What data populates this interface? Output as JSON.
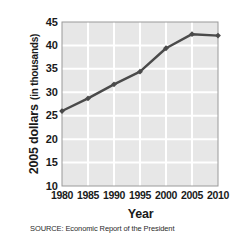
{
  "chart_data": {
    "type": "line",
    "title": "",
    "xlabel": "Year",
    "ylabel": "2005 dollars (in thousands)",
    "ylabel_main": "2005 dollars",
    "ylabel_sub": "(in thousands)",
    "x": [
      1980,
      1985,
      1990,
      1995,
      2000,
      2005,
      2010
    ],
    "values": [
      26.0,
      28.7,
      31.7,
      34.4,
      39.4,
      42.4,
      42.1
    ],
    "series": [
      {
        "name": "2005 dollars (in thousands)",
        "values": [
          26.0,
          28.7,
          31.7,
          34.4,
          39.4,
          42.4,
          42.1
        ]
      }
    ],
    "xtick_labels": [
      "1980",
      "1985",
      "1990",
      "1995",
      "2000",
      "2005",
      "2010"
    ],
    "ytick_labels": [
      "10",
      "15",
      "20",
      "25",
      "30",
      "35",
      "40",
      "45"
    ],
    "ytick_values": [
      10,
      15,
      20,
      25,
      30,
      35,
      40,
      45
    ],
    "xlim": [
      1980,
      2010
    ],
    "ylim": [
      10,
      45
    ],
    "grid": true,
    "legend": false,
    "marker": "diamond",
    "line_color": "#4a4a4a",
    "plot_background": "#e7e7e7",
    "gridline_color": "#ffffff",
    "frame_color": "#9a9a9a"
  },
  "caption": {
    "source": "SOURCE: Economic Report of the President"
  }
}
